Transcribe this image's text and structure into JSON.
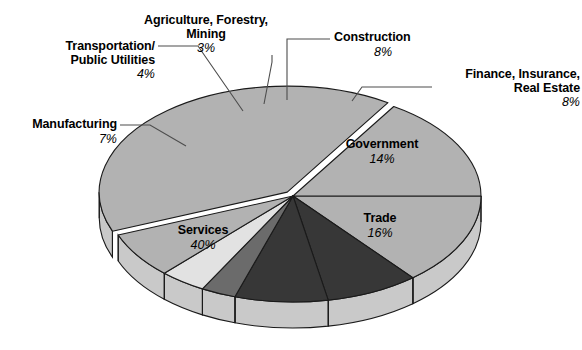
{
  "chart_data": {
    "type": "pie",
    "title": "",
    "subtitle": "",
    "xlabel": "",
    "ylabel": "",
    "legend_position": "none",
    "grid": false,
    "three_d": true,
    "exploded_slices": [
      "Services"
    ],
    "categories": [
      "Services",
      "Trade",
      "Government",
      "Finance, Insurance, Real Estate",
      "Construction",
      "Agriculture, Forestry, Mining",
      "Transportation/ Public Utilities",
      "Manufacturing"
    ],
    "values": [
      40,
      16,
      14,
      8,
      8,
      3,
      4,
      7
    ],
    "unit": "%",
    "slices": [
      {
        "label": "Services",
        "value": 40,
        "display_value": "40%",
        "color": "#b2b2b2",
        "label_placement": "inside"
      },
      {
        "label": "Trade",
        "value": 16,
        "display_value": "16%",
        "color": "#b2b2b2",
        "label_placement": "inside"
      },
      {
        "label": "Government",
        "value": 14,
        "display_value": "14%",
        "color": "#b2b2b2",
        "label_placement": "inside"
      },
      {
        "label": "Finance, Insurance, Real Estate",
        "value": 8,
        "display_value": "8%",
        "color": "#373737",
        "label_placement": "leader"
      },
      {
        "label": "Construction",
        "value": 8,
        "display_value": "8%",
        "color": "#373737",
        "label_placement": "leader"
      },
      {
        "label": "Agriculture, Forestry, Mining",
        "value": 3,
        "display_value": "3%",
        "color": "#6b6b6b",
        "label_placement": "leader"
      },
      {
        "label": "Transportation/ Public Utilities",
        "value": 4,
        "display_value": "4%",
        "color": "#e2e2e2",
        "label_placement": "leader"
      },
      {
        "label": "Manufacturing",
        "value": 7,
        "display_value": "7%",
        "color": "#b2b2b2",
        "label_placement": "leader"
      }
    ]
  },
  "labels": {
    "agriculture": {
      "line1": "Agriculture, Forestry,",
      "line2": "Mining",
      "pct": "3%"
    },
    "transportation": {
      "line1": "Transportation/",
      "line2": "Public Utilities",
      "pct": "4%"
    },
    "manufacturing": {
      "line1": "Manufacturing",
      "pct": "7%"
    },
    "construction": {
      "line1": "Construction",
      "pct": "8%"
    },
    "finance": {
      "line1": "Finance, Insurance,",
      "line2": "Real Estate",
      "pct": "8%"
    },
    "government": {
      "line1": "Government",
      "pct": "14%"
    },
    "trade": {
      "line1": "Trade",
      "pct": "16%"
    },
    "services": {
      "line1": "Services",
      "pct": "40%"
    }
  },
  "colors": {
    "slice_light": "#e2e2e2",
    "slice_medium": "#b2b2b2",
    "slice_mid_dark": "#6b6b6b",
    "slice_dark": "#373737",
    "rim": "#c9c9c9",
    "outline": "#1a1a1a",
    "background": "#ffffff",
    "leader_line": "#4d4d4d"
  }
}
